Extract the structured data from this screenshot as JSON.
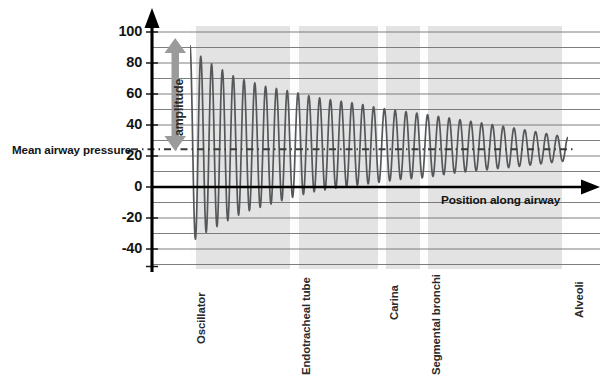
{
  "chart_data": {
    "type": "line",
    "title": "",
    "xlabel": "Position along airway",
    "ylabel": "",
    "ylim": [
      -45,
      100
    ],
    "xlim": [
      0,
      1
    ],
    "grid": true,
    "grid_major_step": 20,
    "grid_minor_step": 10,
    "y_ticks": [
      "100",
      "80",
      "60",
      "40",
      "20",
      "0",
      "-20",
      "-40"
    ],
    "y_tick_values": [
      100,
      80,
      60,
      40,
      20,
      0,
      -20,
      -40
    ],
    "x_categories": [
      "Oscillator",
      "Endotracheal tube",
      "Carina",
      "Segmental bronchi",
      "Alveoli"
    ],
    "x_category_positions": [
      0.0,
      0.278,
      0.511,
      0.622,
      1.0
    ],
    "annotations": {
      "mean_line_label": "Mean airway pressure",
      "mean_line_value": 24,
      "amplitude_label": "amplitude",
      "amplitude_top": 91,
      "amplitude_bottom": 24,
      "axis_arrow_label": "Position along airway"
    },
    "series": [
      {
        "name": "Airway pressure oscillation",
        "description": "Damped sinusoidal pressure waveform attenuating from oscillator to alveoli, converging on the mean airway pressure",
        "baseline": 24,
        "envelope_x": [
          0.0,
          0.03,
          0.06,
          0.09,
          0.12,
          0.16,
          0.2,
          0.24,
          0.28,
          0.33,
          0.38,
          0.44,
          0.5,
          0.56,
          0.62,
          0.7,
          0.78,
          0.86,
          0.93,
          1.0
        ],
        "envelope_peak": [
          91,
          84,
          79,
          75,
          71,
          68,
          65,
          63,
          61,
          58,
          56,
          54,
          51,
          49,
          47,
          44,
          41,
          38,
          35,
          32
        ],
        "envelope_trough": [
          -36,
          -31,
          -27,
          -23,
          -19,
          -15,
          -12,
          -9,
          -6,
          -3,
          -1,
          1,
          3,
          5,
          6,
          9,
          11,
          13,
          15,
          17
        ],
        "cycle_count": 35,
        "color": "#55585a"
      }
    ],
    "colors": {
      "plot_band": "#e3e3e3",
      "band_gap": "#ffffff",
      "gridline": "#6f6f6f",
      "axis": "#000000",
      "wave": "#55585a",
      "amplitude_arrow": "#9b9b9b",
      "mean_line": "#3a3a3a"
    }
  }
}
